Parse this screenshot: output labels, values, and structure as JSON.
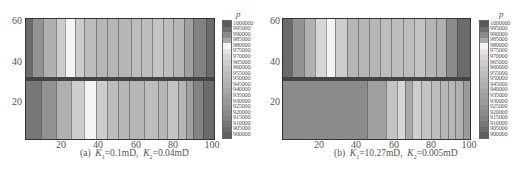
{
  "chart_data": [
    {
      "type": "heatmap",
      "title": "",
      "caption": "(a) K1=0.1mD, K2=0.04mD",
      "caption_parts": {
        "label": "(a)",
        "k1_sym": "K",
        "k1_sub": "1",
        "k1_val": "=0.1mD,",
        "k2_sym": "K",
        "k2_sub": "2",
        "k2_val": "=0.04mD"
      },
      "xlabel": "",
      "ylabel": "",
      "x_ticks": [
        "20",
        "40",
        "60",
        "80",
        "100"
      ],
      "y_ticks": [
        "60",
        "40",
        "20"
      ],
      "xlim": [
        0,
        100
      ],
      "ylim": [
        0,
        62
      ],
      "colorbar_title": "p",
      "colorbar_labels": [
        "1000000",
        "995000",
        "990000",
        "985000",
        "980000",
        "975000",
        "970000",
        "965000",
        "960000",
        "955000",
        "950000",
        "945000",
        "940000",
        "935000",
        "930000",
        "925000",
        "920000",
        "915000",
        "910000",
        "905000",
        "900000"
      ],
      "layers": {
        "top": {
          "y_range": [
            32,
            62
          ],
          "bands": [
            {
              "x0": 0,
              "x1": 3,
              "p": 905000
            },
            {
              "x0": 3,
              "x1": 9,
              "p": 925000
            },
            {
              "x0": 9,
              "x1": 16,
              "p": 945000
            },
            {
              "x0": 16,
              "x1": 21,
              "p": 965000
            },
            {
              "x0": 21,
              "x1": 26,
              "p": 980000
            },
            {
              "x0": 26,
              "x1": 31,
              "p": 965000
            },
            {
              "x0": 31,
              "x1": 37,
              "p": 955000
            },
            {
              "x0": 37,
              "x1": 43,
              "p": 950000
            },
            {
              "x0": 43,
              "x1": 49,
              "p": 950000
            },
            {
              "x0": 49,
              "x1": 56,
              "p": 950000
            },
            {
              "x0": 56,
              "x1": 61,
              "p": 955000
            },
            {
              "x0": 61,
              "x1": 67,
              "p": 955000
            },
            {
              "x0": 67,
              "x1": 73,
              "p": 960000
            },
            {
              "x0": 73,
              "x1": 78,
              "p": 955000
            },
            {
              "x0": 78,
              "x1": 84,
              "p": 950000
            },
            {
              "x0": 84,
              "x1": 89,
              "p": 935000
            },
            {
              "x0": 89,
              "x1": 96,
              "p": 915000
            },
            {
              "x0": 96,
              "x1": 100,
              "p": 905000
            }
          ]
        },
        "bottom": {
          "y_range": [
            0,
            30
          ],
          "bands": [
            {
              "x0": 0,
              "x1": 8,
              "p": 910000
            },
            {
              "x0": 8,
              "x1": 16,
              "p": 925000
            },
            {
              "x0": 16,
              "x1": 24,
              "p": 945000
            },
            {
              "x0": 24,
              "x1": 31,
              "p": 965000
            },
            {
              "x0": 31,
              "x1": 37,
              "p": 980000
            },
            {
              "x0": 37,
              "x1": 43,
              "p": 965000
            },
            {
              "x0": 43,
              "x1": 49,
              "p": 955000
            },
            {
              "x0": 49,
              "x1": 55,
              "p": 950000
            },
            {
              "x0": 55,
              "x1": 63,
              "p": 950000
            },
            {
              "x0": 63,
              "x1": 70,
              "p": 955000
            },
            {
              "x0": 70,
              "x1": 75,
              "p": 950000
            },
            {
              "x0": 75,
              "x1": 81,
              "p": 960000
            },
            {
              "x0": 81,
              "x1": 85,
              "p": 950000
            },
            {
              "x0": 85,
              "x1": 89,
              "p": 935000
            },
            {
              "x0": 89,
              "x1": 94,
              "p": 915000
            },
            {
              "x0": 94,
              "x1": 100,
              "p": 905000
            }
          ]
        }
      }
    },
    {
      "type": "heatmap",
      "title": "",
      "caption": "(b) K1=10.27mD, K2=0.005mD",
      "caption_parts": {
        "label": "(b)",
        "k1_sym": "K",
        "k1_sub": "1",
        "k1_val": "=10.27mD,",
        "k2_sym": "K",
        "k2_sub": "2",
        "k2_val": "=0.005mD"
      },
      "xlabel": "",
      "ylabel": "",
      "x_ticks": [
        "20",
        "40",
        "60",
        "80",
        "100"
      ],
      "y_ticks": [
        "60",
        "40",
        "20"
      ],
      "xlim": [
        0,
        100
      ],
      "ylim": [
        0,
        62
      ],
      "colorbar_title": "p",
      "colorbar_labels": [
        "1000000",
        "995000",
        "990000",
        "985000",
        "980000",
        "975000",
        "970000",
        "965000",
        "960000",
        "955000",
        "950000",
        "945000",
        "940000",
        "935000",
        "930000",
        "925000",
        "920000",
        "915000",
        "910000",
        "905000",
        "900000"
      ],
      "layers": {
        "top": {
          "y_range": [
            32,
            62
          ],
          "bands": [
            {
              "x0": 0,
              "x1": 5,
              "p": 905000
            },
            {
              "x0": 5,
              "x1": 11,
              "p": 925000
            },
            {
              "x0": 11,
              "x1": 17,
              "p": 945000
            },
            {
              "x0": 17,
              "x1": 23,
              "p": 970000
            },
            {
              "x0": 23,
              "x1": 28,
              "p": 980000
            },
            {
              "x0": 28,
              "x1": 34,
              "p": 965000
            },
            {
              "x0": 34,
              "x1": 40,
              "p": 950000
            },
            {
              "x0": 40,
              "x1": 46,
              "p": 950000
            },
            {
              "x0": 46,
              "x1": 52,
              "p": 950000
            },
            {
              "x0": 52,
              "x1": 58,
              "p": 955000
            },
            {
              "x0": 58,
              "x1": 64,
              "p": 955000
            },
            {
              "x0": 64,
              "x1": 70,
              "p": 955000
            },
            {
              "x0": 70,
              "x1": 76,
              "p": 960000
            },
            {
              "x0": 76,
              "x1": 82,
              "p": 950000
            },
            {
              "x0": 82,
              "x1": 87,
              "p": 945000
            },
            {
              "x0": 87,
              "x1": 93,
              "p": 920000
            },
            {
              "x0": 93,
              "x1": 100,
              "p": 905000
            }
          ]
        },
        "bottom": {
          "y_range": [
            0,
            30
          ],
          "bands": [
            {
              "x0": 0,
              "x1": 45,
              "p": 920000
            },
            {
              "x0": 45,
              "x1": 55,
              "p": 935000
            },
            {
              "x0": 55,
              "x1": 61,
              "p": 960000
            },
            {
              "x0": 61,
              "x1": 65,
              "p": 970000
            },
            {
              "x0": 65,
              "x1": 69,
              "p": 985000
            },
            {
              "x0": 69,
              "x1": 74,
              "p": 965000
            },
            {
              "x0": 74,
              "x1": 79,
              "p": 960000
            },
            {
              "x0": 79,
              "x1": 84,
              "p": 955000
            },
            {
              "x0": 84,
              "x1": 88,
              "p": 950000
            },
            {
              "x0": 88,
              "x1": 92,
              "p": 950000
            },
            {
              "x0": 92,
              "x1": 96,
              "p": 945000
            },
            {
              "x0": 96,
              "x1": 100,
              "p": 930000
            }
          ]
        }
      }
    }
  ],
  "colorbar_gray": {
    "1000000": "#5a5a5a",
    "995000": "#6e6e6e",
    "990000": "#8a8a8a",
    "985000": "#a9a9a9",
    "980000": "#f4f4f4",
    "975000": "#e4e4e4",
    "970000": "#d6d6d6",
    "965000": "#cdcdcd",
    "960000": "#c4c4c4",
    "955000": "#bdbdbd",
    "950000": "#b6b6b6",
    "945000": "#b0b0b0",
    "940000": "#a8a8a8",
    "935000": "#a0a0a0",
    "930000": "#9a9a9a",
    "925000": "#929292",
    "920000": "#8b8b8b",
    "915000": "#828282",
    "910000": "#777777",
    "905000": "#6b6b6b",
    "900000": "#5e5e5e"
  }
}
